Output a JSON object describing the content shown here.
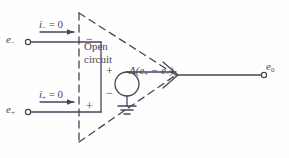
{
  "diagram": {
    "stroke_color": "#4a4458",
    "background_color": "#fefefe",
    "labels": {
      "input_minus_terminal": "e",
      "input_minus_sub": "−",
      "input_plus_terminal": "e",
      "input_plus_sub": "+",
      "current_minus": "i",
      "current_minus_sub": "−",
      "current_minus_value": " = 0",
      "current_plus": "i",
      "current_plus_sub": "+",
      "current_plus_value": " = 0",
      "open_line1": "Open",
      "open_line2": "circuit",
      "dependent_source": "A(e",
      "dependent_source_sub1": "+",
      "dependent_source_mid": " − e",
      "dependent_source_sub2": "−",
      "dependent_source_end": ")",
      "output_terminal": "e",
      "output_sub": "0",
      "sign_minus_input": "−",
      "sign_plus_input": "+",
      "sign_plus_source": "+",
      "sign_minus_source": "−"
    },
    "elements": {
      "triangle": "dashed-amplifier-outline",
      "source_symbol": "dependent-voltage-source-circle",
      "ground_symbol": "earth-ground",
      "terminal_markers": "open-circle-nodes"
    }
  }
}
